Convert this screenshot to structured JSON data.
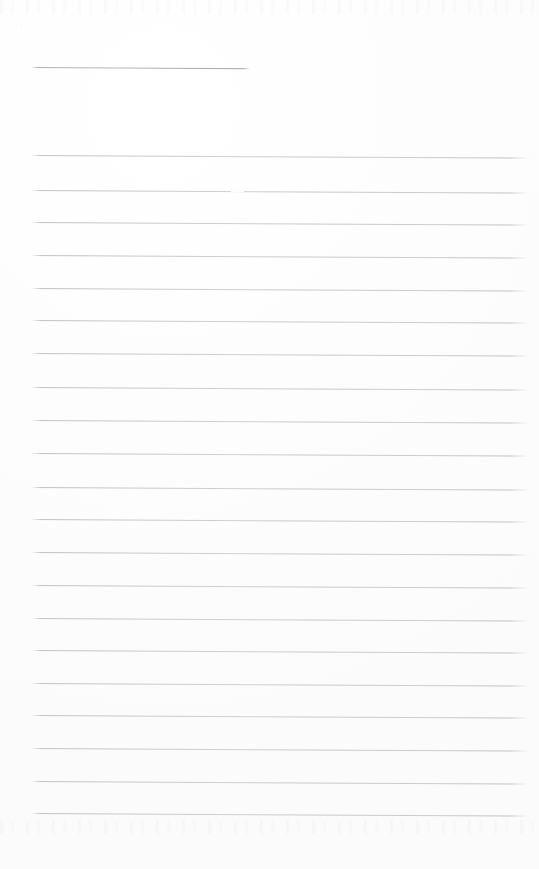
{
  "document": {
    "kind": "scanned-lined-notepad-page",
    "title": "Blank lined notepad page (scan)",
    "orientation": "portrait",
    "page_width": 539,
    "page_height": 869,
    "background_color": "#fdfdfd",
    "rule_color": "#c9ccd1",
    "rule_color_header": "#aab0ba",
    "content_text": "",
    "is_blank": true
  },
  "layout": {
    "rule_left": 31,
    "rule_right": 529,
    "rule_slant_degrees": 0.3,
    "rule_thickness": 1,
    "rule_spacing": 32.7,
    "margin_top": 67,
    "margin_bottom": 56
  },
  "rules": [
    {
      "name": "header-rule",
      "y": 67,
      "x": 31,
      "width": 219,
      "style": "short"
    },
    {
      "name": "body-rule-01",
      "y": 155,
      "x": 31,
      "width": 498,
      "style": "full"
    },
    {
      "name": "body-rule-02",
      "y": 190,
      "x": 31,
      "width": 498,
      "style": "full"
    },
    {
      "name": "body-rule-03",
      "y": 222,
      "x": 31,
      "width": 498,
      "style": "full"
    },
    {
      "name": "body-rule-04",
      "y": 255,
      "x": 31,
      "width": 498,
      "style": "full"
    },
    {
      "name": "body-rule-05",
      "y": 288,
      "x": 31,
      "width": 498,
      "style": "full"
    },
    {
      "name": "body-rule-06",
      "y": 320,
      "x": 31,
      "width": 498,
      "style": "full"
    },
    {
      "name": "body-rule-07",
      "y": 353,
      "x": 31,
      "width": 498,
      "style": "full"
    },
    {
      "name": "body-rule-08",
      "y": 387,
      "x": 31,
      "width": 498,
      "style": "full"
    },
    {
      "name": "body-rule-09",
      "y": 420,
      "x": 31,
      "width": 498,
      "style": "full"
    },
    {
      "name": "body-rule-10",
      "y": 453,
      "x": 31,
      "width": 498,
      "style": "full"
    },
    {
      "name": "body-rule-11",
      "y": 487,
      "x": 31,
      "width": 498,
      "style": "full"
    },
    {
      "name": "body-rule-12",
      "y": 519,
      "x": 31,
      "width": 498,
      "style": "full"
    },
    {
      "name": "body-rule-13",
      "y": 552,
      "x": 31,
      "width": 498,
      "style": "full"
    },
    {
      "name": "body-rule-14",
      "y": 585,
      "x": 31,
      "width": 498,
      "style": "full"
    },
    {
      "name": "body-rule-15",
      "y": 618,
      "x": 31,
      "width": 498,
      "style": "full"
    },
    {
      "name": "body-rule-16",
      "y": 650,
      "x": 31,
      "width": 498,
      "style": "full"
    },
    {
      "name": "body-rule-17",
      "y": 683,
      "x": 31,
      "width": 498,
      "style": "full"
    },
    {
      "name": "body-rule-18",
      "y": 715,
      "x": 31,
      "width": 498,
      "style": "full"
    },
    {
      "name": "body-rule-19",
      "y": 748,
      "x": 31,
      "width": 498,
      "style": "full"
    },
    {
      "name": "body-rule-20",
      "y": 781,
      "x": 31,
      "width": 498,
      "style": "full"
    },
    {
      "name": "body-rule-21",
      "y": 813,
      "x": 31,
      "width": 498,
      "style": "full"
    }
  ],
  "artifacts": [
    {
      "name": "scan-dropout-gap",
      "x": 231,
      "y": 189,
      "width": 13,
      "height": 3
    }
  ]
}
